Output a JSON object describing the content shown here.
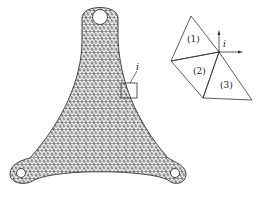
{
  "figure": {
    "type": "finite-element-mesh-diagram",
    "mesh": {
      "description": "Triangular finite element mesh of a three-lug plate",
      "element_type": "triangle",
      "node_marker_label": "i"
    },
    "detail_inset": {
      "node_label": "i",
      "element_labels": [
        "(1)",
        "(2)",
        "(3)"
      ]
    },
    "colors": {
      "line": "#333333",
      "background": "#ffffff"
    }
  }
}
